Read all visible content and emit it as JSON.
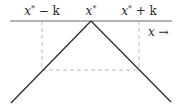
{
  "diagram": {
    "labels": {
      "left": "x* − k",
      "center": "x*",
      "right": "x* + k",
      "axis": "x →"
    },
    "label_parts": {
      "left_var": "x",
      "left_sup": "*",
      "left_tail": " − k",
      "center_var": "x",
      "center_sup": "*",
      "right_var": "x",
      "right_sup": "*",
      "right_tail": " + k",
      "axis_var": "x",
      "axis_arrow": " →"
    },
    "colors": {
      "line": "#333333",
      "dashed": "#b5b5b5",
      "text": "#2a2a2a"
    },
    "geometry": {
      "axis_y": 21,
      "axis_x0": 10,
      "axis_x1": 172,
      "apex": [
        91,
        21
      ],
      "left_end": [
        11,
        103
      ],
      "right_end": [
        171,
        102
      ],
      "dashed_left_x": 42,
      "dashed_right_x": 139,
      "dashed_bottom_y": 70
    }
  }
}
